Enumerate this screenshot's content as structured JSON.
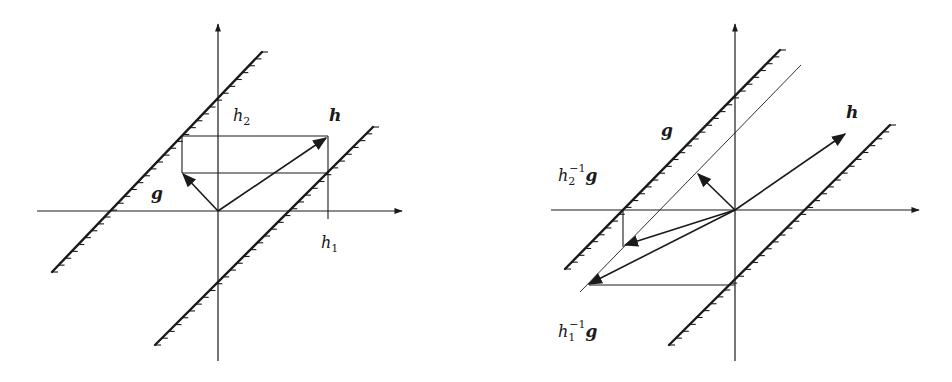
{
  "figure": {
    "left_panel": {
      "labels": {
        "h2": {
          "base": "h",
          "sub": "2"
        },
        "h": {
          "text": "h"
        },
        "g": {
          "text": "g"
        },
        "h1": {
          "base": "h",
          "sub": "1"
        }
      }
    },
    "right_panel": {
      "labels": {
        "h": {
          "text": "h"
        },
        "g": {
          "text": "g"
        },
        "h2inv_g": {
          "base": "h",
          "sub": "2",
          "sup": "−1",
          "tail": "g"
        },
        "h1inv_g": {
          "base": "h",
          "sub": "1",
          "sup": "−1",
          "tail": "g"
        }
      }
    },
    "colors": {
      "ink": "#1a1a1a",
      "background": "#ffffff"
    }
  }
}
